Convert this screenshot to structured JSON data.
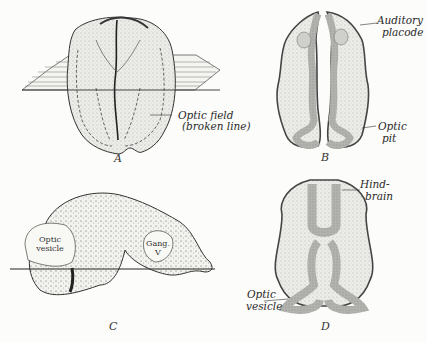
{
  "figure": {
    "panels": [
      {
        "letter": "A",
        "labels": [
          {
            "text": "Optic field"
          },
          {
            "text": "(broken line)"
          }
        ]
      },
      {
        "letter": "B",
        "labels": [
          {
            "text": "Auditory"
          },
          {
            "text": "placode"
          },
          {
            "text": "Optic"
          },
          {
            "text": "pit"
          }
        ]
      },
      {
        "letter": "C",
        "labels": [
          {
            "text": "Optic"
          },
          {
            "text": "vesicle"
          },
          {
            "text": "Gang."
          },
          {
            "text": "V"
          }
        ]
      },
      {
        "letter": "D",
        "labels": [
          {
            "text": "Hind-"
          },
          {
            "text": "brain"
          },
          {
            "text": "Optic"
          },
          {
            "text": "vesicle"
          }
        ]
      }
    ],
    "colors": {
      "ink": "#2a2a2a",
      "tissue": "#e6e6e2",
      "neural": "#a8a8a4",
      "paper": "#fcfcfa"
    }
  }
}
